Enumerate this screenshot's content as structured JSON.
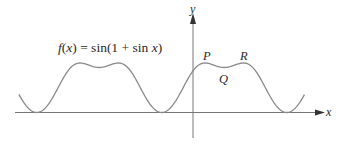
{
  "figure": {
    "formula": {
      "f": "f",
      "open": "(",
      "x": "x",
      "rest": ") = sin(1 + sin ",
      "x2": "x",
      "close": ")"
    },
    "axes": {
      "x_label": "x",
      "y_label": "y"
    },
    "points": {
      "P": "P",
      "Q": "Q",
      "R": "R"
    }
  },
  "chart_data": {
    "type": "line",
    "title": "f(x) = sin(1 + sin x)",
    "xlabel": "x",
    "ylabel": "y",
    "function": "sin(1 + sin x)",
    "x_range_radians": [
      -8.75,
      5.6
    ],
    "ylim": [
      0,
      1
    ],
    "grid": false,
    "legend": null,
    "annotations": [
      {
        "label": "P",
        "desc": "local max",
        "x": 0.6155,
        "y": 1.0
      },
      {
        "label": "Q",
        "desc": "local min",
        "x": 1.5708,
        "y": 0.909
      },
      {
        "label": "R",
        "desc": "local max",
        "x": 2.526,
        "y": 1.0
      }
    ],
    "key_values": {
      "f(0)": 0.841,
      "max": 1.0,
      "min": 0.0,
      "min_at": "x = -π/2 + 2kπ",
      "period": "2π"
    }
  },
  "style": {
    "curve_color": "#8a8a8a",
    "axis_color": "#555555"
  }
}
